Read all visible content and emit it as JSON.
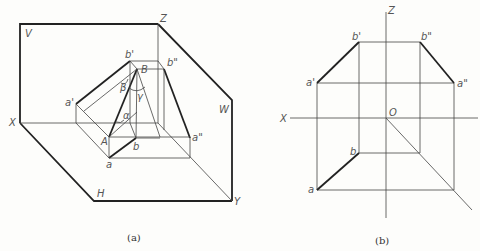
{
  "figure_a": {
    "caption": "(a)",
    "planes": {
      "V": "V",
      "H": "H",
      "W": "W"
    },
    "axes": {
      "X": "X",
      "Y": "Y",
      "Z": "Z"
    },
    "points": {
      "b_prime": "b'",
      "B": "B",
      "b_dprime": "b\"",
      "a_prime": "a'",
      "A": "A",
      "a": "a",
      "b": "b",
      "a_dprime": "a\""
    },
    "angles": {
      "alpha": "α",
      "beta": "β",
      "gamma": "γ"
    }
  },
  "figure_b": {
    "caption": "(b)",
    "axes": {
      "X": "X",
      "Z": "Z",
      "O": "O"
    },
    "points": {
      "b_prime": "b'",
      "b_dprime": "b\"",
      "a_prime": "a'",
      "a_dprime": "a\"",
      "b": "b",
      "a": "a"
    }
  }
}
